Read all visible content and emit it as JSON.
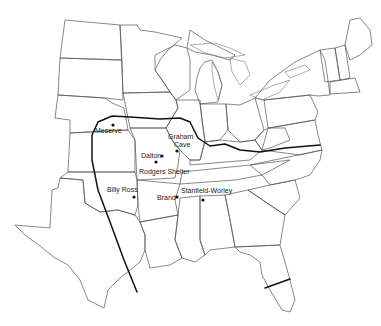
{
  "map": {
    "title": "",
    "region": "Eastern and Central United States",
    "range_boundary": "thick curved line",
    "sites": [
      {
        "name": "Meserve",
        "label": "Meserve",
        "dot": [
          113,
          125
        ],
        "label_pos": [
          94,
          127
        ]
      },
      {
        "name": "Graham Cave",
        "label_line1": "Graham",
        "label_line2": "Cave",
        "dot": [
          177,
          151
        ],
        "label_pos": [
          168,
          133
        ]
      },
      {
        "name": "Dalton",
        "label": "Dalton",
        "dot": [
          162,
          156
        ],
        "label_pos": [
          140,
          152
        ]
      },
      {
        "name": "Rodgers Shelter",
        "label": "Rodgers Shelter",
        "dot": [
          156,
          162
        ],
        "label_pos": [
          139,
          169
        ]
      },
      {
        "name": "Billy Ross",
        "label": "Billy Ross",
        "dot": [
          134,
          197
        ],
        "label_pos": [
          107,
          186
        ]
      },
      {
        "name": "Brand",
        "label": "Brand",
        "dot": [
          177,
          197
        ],
        "label_pos": [
          157,
          194
        ]
      },
      {
        "name": "Stanfield-Worley",
        "label": "Stanfield-Worley",
        "dot": [
          203,
          200
        ],
        "label_pos": [
          182,
          187
        ]
      }
    ]
  }
}
